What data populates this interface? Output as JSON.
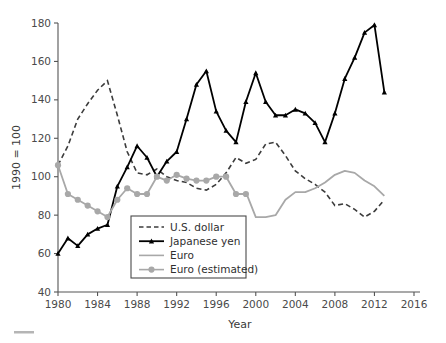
{
  "figure": {
    "background_color": "#ffffff",
    "width": 446,
    "height": 343
  },
  "axes": {
    "y_label": "1990 = 100",
    "x_label": "Year",
    "y_ticks": [
      "40",
      "60",
      "80",
      "100",
      "120",
      "140",
      "160",
      "180"
    ],
    "x_ticks": [
      "1980",
      "1984",
      "1988",
      "1992",
      "1996",
      "2000",
      "2004",
      "2008",
      "2012",
      "2016"
    ]
  },
  "legend": {
    "items": [
      {
        "label": "U.S. dollar",
        "style": "dashed",
        "color": "#3c3c3c",
        "marker": "none"
      },
      {
        "label": "Japanese yen",
        "style": "solid",
        "color": "#000000",
        "marker": "triangle"
      },
      {
        "label": "Euro",
        "style": "solid",
        "color": "#a8a8a8",
        "marker": "none"
      },
      {
        "label": "Euro (estimated)",
        "style": "solid",
        "color": "#a8a8a8",
        "marker": "circle"
      }
    ]
  },
  "chart_data": {
    "type": "line",
    "title": "",
    "subtitle": "",
    "xlabel": "Year",
    "ylabel": "1990 = 100",
    "xlim": [
      1980,
      2016
    ],
    "ylim": [
      40,
      180
    ],
    "ytick_step": 20,
    "xtick_step": 4,
    "grid": false,
    "legend_position": "inside-bottom-left",
    "series": [
      {
        "name": "U.S. dollar",
        "color": "#3c3c3c",
        "linestyle": "dashed",
        "marker": "none",
        "x": [
          1980,
          1981,
          1982,
          1983,
          1984,
          1985,
          1986,
          1987,
          1988,
          1989,
          1990,
          1991,
          1992,
          1993,
          1994,
          1995,
          1996,
          1997,
          1998,
          1999,
          2000,
          2001,
          2002,
          2003,
          2004,
          2005,
          2006,
          2007,
          2008,
          2009,
          2010,
          2011,
          2012,
          2013
        ],
        "y": [
          106,
          116,
          130,
          138,
          145,
          150,
          132,
          113,
          102,
          101,
          104,
          100,
          98,
          97,
          94,
          93,
          96,
          102,
          110,
          107,
          109,
          117,
          118,
          111,
          103,
          99,
          96,
          92,
          85,
          86,
          83,
          79,
          82,
          88
        ]
      },
      {
        "name": "Japanese yen",
        "color": "#000000",
        "linestyle": "solid",
        "marker": "triangle",
        "x": [
          1980,
          1981,
          1982,
          1983,
          1984,
          1985,
          1986,
          1987,
          1988,
          1989,
          1990,
          1991,
          1992,
          1993,
          1994,
          1995,
          1996,
          1997,
          1998,
          1999,
          2000,
          2001,
          2002,
          2003,
          2004,
          2005,
          2006,
          2007,
          2008,
          2009,
          2010,
          2011,
          2012,
          2013
        ],
        "y": [
          60,
          68,
          64,
          70,
          73,
          75,
          95,
          105,
          116,
          110,
          100,
          108,
          113,
          130,
          148,
          155,
          134,
          124,
          118,
          139,
          154,
          139,
          132,
          132,
          135,
          133,
          128,
          118,
          133,
          151,
          162,
          175,
          179,
          144
        ]
      },
      {
        "name": "Euro",
        "color": "#a8a8a8",
        "linestyle": "solid",
        "marker": "none",
        "x": [
          1999,
          2000,
          2001,
          2002,
          2003,
          2004,
          2005,
          2006,
          2007,
          2008,
          2009,
          2010,
          2011,
          2012,
          2013
        ],
        "y": [
          92,
          79,
          79,
          80,
          88,
          92,
          92,
          94,
          97,
          101,
          103,
          102,
          98,
          95,
          90
        ]
      },
      {
        "name": "Euro (estimated)",
        "color": "#a8a8a8",
        "linestyle": "solid",
        "marker": "circle",
        "x": [
          1980,
          1981,
          1982,
          1983,
          1984,
          1985,
          1986,
          1987,
          1988,
          1989,
          1990,
          1991,
          1992,
          1993,
          1994,
          1995,
          1996,
          1997,
          1998,
          1999
        ],
        "y": [
          106,
          91,
          88,
          85,
          82,
          79,
          88,
          94,
          91,
          91,
          100,
          98,
          101,
          99,
          98,
          98,
          100,
          100,
          91,
          91
        ]
      }
    ],
    "annotations": []
  }
}
